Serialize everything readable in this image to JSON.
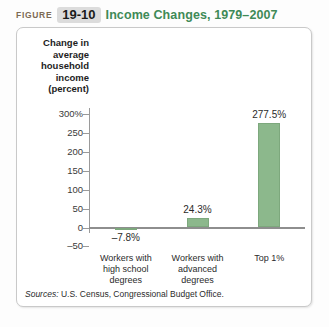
{
  "figure": {
    "label": "FIGURE",
    "number": "19-10",
    "title": "Income Changes, 1979–2007"
  },
  "source": {
    "prefix": "Sources:",
    "text": "U.S. Census, Congressional Budget Office."
  },
  "colors": {
    "bar_fill": "#8cb88c",
    "bar_stroke": "#7da87d",
    "title_green": "#3f8a57",
    "figure_label": "#7d6a55",
    "axis": "#9a9a9a"
  },
  "chart_data": {
    "type": "bar",
    "title": "Income Changes, 1979–2007",
    "xlabel": "",
    "ylabel": "Change in average household income (percent)",
    "categories": [
      "Workers with high school degrees",
      "Workers with advanced degrees",
      "Top 1%"
    ],
    "values": [
      -7.8,
      24.3,
      277.5
    ],
    "data_labels": [
      "–7.8%",
      "24.3%",
      "277.5%"
    ],
    "ylim": [
      -50,
      300
    ],
    "yticks": [
      300,
      250,
      200,
      150,
      100,
      50,
      0,
      -50
    ],
    "ytick_labels": [
      "300%",
      "250",
      "200",
      "150",
      "100",
      "50",
      "0",
      "–50"
    ],
    "grid": false,
    "legend": false
  }
}
